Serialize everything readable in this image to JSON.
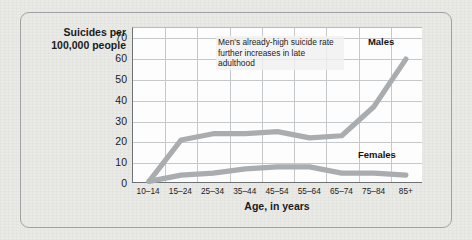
{
  "chart_data": {
    "type": "line",
    "title": "",
    "ylabel": "Suicides per 100,000 people",
    "ylabel_line1": "Suicides per",
    "ylabel_line2": "100,000 people",
    "xlabel": "Age, in years",
    "categories": [
      "10–14",
      "15–24",
      "25–34",
      "35–44",
      "45–54",
      "55–64",
      "65–74",
      "75–84",
      "85+"
    ],
    "yticks": [
      0,
      10,
      20,
      30,
      40,
      50,
      60,
      70
    ],
    "ylim": [
      0,
      75
    ],
    "grid": true,
    "legend_position": "inline-labels",
    "series": [
      {
        "name": "Males",
        "values": [
          1,
          21,
          24,
          24,
          25,
          22,
          23,
          37,
          60
        ],
        "color": "#a9adb0"
      },
      {
        "name": "Females",
        "values": [
          1,
          4,
          5,
          7,
          8,
          8,
          5,
          5,
          4
        ],
        "color": "#a9adb0"
      }
    ],
    "annotations": [
      {
        "name": "males-late-adulthood-note",
        "text": "Men's already-high suicide rate further increases in late adulthood",
        "line1": "Men's already-high suicide",
        "line2": "rate further increases",
        "line3": "in late adulthood"
      }
    ]
  },
  "colors": {
    "page_background": "#e9e9e6",
    "plot_background": "#fdfdfd",
    "gridline": "#c6c9cb",
    "axis": "#6e7274",
    "series_line": "#a9adb0",
    "frame_border": "#9fa2a4",
    "text": "#1b1b1b"
  }
}
